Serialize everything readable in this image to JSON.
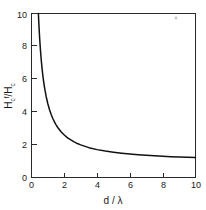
{
  "chart_data": {
    "type": "line",
    "title": "",
    "xlabel": "d / λ",
    "ylabel": "H_c^f / H_c",
    "ylabel_parts": {
      "main1": "H",
      "sub1": "c",
      "sup1": "f",
      "slash": "/",
      "main2": "H",
      "sub2": "c"
    },
    "xlim": [
      0,
      10
    ],
    "ylim": [
      0,
      10
    ],
    "xticks": [
      0,
      2,
      4,
      6,
      8,
      10
    ],
    "yticks": [
      0,
      2,
      4,
      6,
      8,
      10
    ],
    "xticklabels": [
      "0",
      "2",
      "4",
      "6",
      "8",
      "10"
    ],
    "yticklabels": [
      "0",
      "2",
      "4",
      "6",
      "8",
      "10"
    ],
    "grid": false,
    "legend": false,
    "tick_direction": "in",
    "series": [
      {
        "name": "Hcf/Hc",
        "x": [
          0.42,
          0.45,
          0.5,
          0.55,
          0.6,
          0.65,
          0.7,
          0.75,
          0.8,
          0.9,
          1.0,
          1.1,
          1.2,
          1.3,
          1.4,
          1.5,
          1.6,
          1.8,
          2.0,
          2.2,
          2.4,
          2.6,
          2.8,
          3.0,
          3.5,
          4.0,
          4.5,
          5.0,
          5.5,
          6.0,
          6.5,
          7.0,
          7.5,
          8.0,
          8.5,
          9.0,
          9.5,
          10.0
        ],
        "y": [
          10.0,
          9.35,
          8.45,
          7.71,
          7.1,
          6.59,
          6.15,
          5.78,
          5.45,
          4.91,
          4.48,
          4.13,
          3.84,
          3.6,
          3.39,
          3.21,
          3.05,
          2.79,
          2.59,
          2.42,
          2.29,
          2.17,
          2.07,
          1.99,
          1.82,
          1.7,
          1.61,
          1.54,
          1.48,
          1.43,
          1.39,
          1.35,
          1.32,
          1.3,
          1.27,
          1.25,
          1.24,
          1.22
        ]
      }
    ],
    "asymptote": 1.0
  },
  "artifacts": {
    "speck_label": "image-speck"
  },
  "colors": {
    "background": "#ffffff",
    "axis": "#2a2a2a",
    "curve": "#111111",
    "text": "#1a1a1a"
  }
}
